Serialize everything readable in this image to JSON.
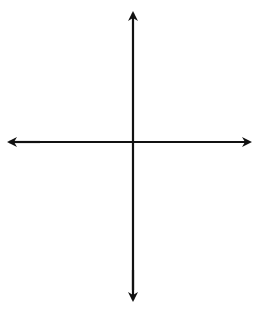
{
  "chart_data": {
    "type": "line",
    "title": "",
    "equation_label": "y = x² − 4",
    "xlabel": "x",
    "ylabel": "y",
    "xlim": [
      -4,
      4
    ],
    "ylim": [
      -5,
      4
    ],
    "grid": true,
    "grid_step": 1,
    "x_ticks_labeled": [
      {
        "value": -2,
        "label": "−2"
      },
      {
        "value": 0,
        "label": "0"
      },
      {
        "value": 2,
        "label": "2"
      }
    ],
    "y_ticks_labeled": [
      {
        "value": 2,
        "label": "2"
      },
      {
        "value": -2,
        "label": "−2"
      },
      {
        "value": -4,
        "label": "−4"
      }
    ],
    "series": [
      {
        "name": "y = x^2 - 4",
        "function": "x^2 - 4",
        "color": "#808080",
        "x": [
          -2.83,
          -2.5,
          -2,
          -1.5,
          -1,
          -0.5,
          0,
          0.5,
          1,
          1.5,
          2,
          2.5,
          2.83
        ],
        "y": [
          4,
          2.25,
          0,
          -1.75,
          -3,
          -3.75,
          -4,
          -3.75,
          -3,
          -1.75,
          0,
          2.25,
          4
        ]
      }
    ],
    "key_points": {
      "x_intercepts": [
        -2,
        2
      ],
      "vertex": [
        0,
        -4
      ]
    }
  },
  "labels": {
    "x_axis": "x",
    "y_axis": "y",
    "tick_neg2_x": "−2",
    "tick_0": "0",
    "tick_2_x": "2",
    "tick_2_y": "2",
    "tick_neg2_y": "−2",
    "tick_neg4_y": "−4",
    "eq_y": "y",
    "eq_mid": " = ",
    "eq_x": "x",
    "eq_exp": "2",
    "eq_tail": " − 4"
  },
  "colors": {
    "grid": "#c8c8c8",
    "axis": "#111111",
    "curve": "#808080"
  }
}
